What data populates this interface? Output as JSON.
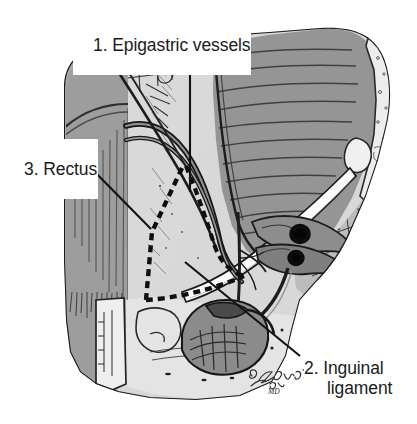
{
  "figure": {
    "kind": "anatomical-illustration",
    "width": 417,
    "height": 424
  },
  "labels": [
    {
      "id": "1",
      "text": "1. Epigastric vessels",
      "lines": [
        "1. Epigastric vessels"
      ]
    },
    {
      "id": "2",
      "text": "2. Inguinal ligament",
      "lines": [
        "2. Inguinal",
        "ligament"
      ]
    },
    {
      "id": "3",
      "text": "3. Rectus",
      "lines": [
        "3. Rectus"
      ]
    }
  ],
  "signature": {
    "name": "Zgotia",
    "credential": "MD"
  },
  "colors": {
    "background": "#ffffff",
    "aponeurosis_light": "#d6d6d6",
    "muscle_mid": "#989898",
    "muscle_dark": "#7d7d7d",
    "shadow_band": "#a8a8a8",
    "bone_pale": "#ececec",
    "ink": "#1a1a1a",
    "ligament_white": "#fdfdfd",
    "vessel_lumen": "#0d0d0d"
  },
  "leaders": [
    {
      "for": "1",
      "from": [
        190,
        33
      ],
      "to": [
        190,
        192
      ]
    },
    {
      "for": "2",
      "from": [
        300,
        355
      ],
      "to": [
        185,
        262
      ]
    },
    {
      "for": "3",
      "from": [
        85,
        162
      ],
      "to": [
        151,
        229
      ]
    }
  ]
}
